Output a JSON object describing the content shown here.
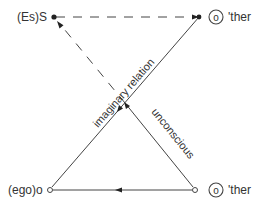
{
  "diagram": {
    "type": "schema-L",
    "nodes": {
      "top_left": {
        "label": "(Es)S"
      },
      "top_right": {
        "symbol": "o",
        "label": "'ther"
      },
      "bottom_left": {
        "label": "(ego)o"
      },
      "bottom_right": {
        "symbol": "o",
        "label": "'ther"
      }
    },
    "edges": {
      "imaginary": {
        "label": "imaginary relation"
      },
      "unconscious": {
        "label": "unconscious"
      }
    },
    "colors": {
      "line": "#333333",
      "background": "#ffffff"
    }
  }
}
